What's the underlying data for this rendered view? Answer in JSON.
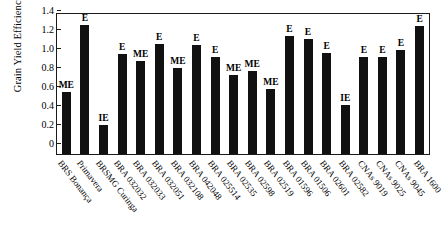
{
  "chart_data": {
    "type": "bar",
    "title": "",
    "xlabel": "",
    "ylabel": "Grain Yield Efficiency Index",
    "ylim": [
      0,
      1.5
    ],
    "yticks": [
      "0",
      "0.2",
      "0.4",
      "0.6",
      "0.8",
      "1.0",
      "1.2",
      "1.4"
    ],
    "ytick_values": [
      0,
      0.2,
      0.4,
      0.6,
      0.8,
      1.0,
      1.2,
      1.4
    ],
    "grid": false,
    "legend": "none",
    "bar_color": "#111111",
    "categories": [
      "BRS Bonança",
      "Primavera",
      "BRSMG Curinga",
      "BRA 032032",
      "BRA 032033",
      "BRA 032051",
      "BRA 032108",
      "BRA 042048",
      "BRA 025514",
      "BRA 02535",
      "BRA 02598",
      "BRA 02519",
      "BRA 01596",
      "BRA 01506",
      "BRA 02601",
      "BRA 02582",
      "CNAs 9019",
      "CNAs 9025",
      "CNAs 9045",
      "BRA 1600"
    ],
    "values": [
      0.66,
      1.36,
      0.31,
      1.06,
      0.98,
      1.16,
      0.91,
      1.15,
      1.02,
      0.83,
      0.88,
      0.69,
      1.25,
      1.21,
      1.07,
      0.52,
      1.02,
      1.03,
      1.1,
      1.35
    ],
    "annotations": [
      "ME",
      "E",
      "IE",
      "E",
      "ME",
      "E",
      "ME",
      "E",
      "E",
      "ME",
      "ME",
      "ME",
      "E",
      "E",
      "E",
      "IE",
      "E",
      "E",
      "E",
      "E"
    ],
    "annotation_key": {
      "E": "Efficient",
      "ME": "Moderately Efficient",
      "IE": "Inefficient"
    }
  }
}
